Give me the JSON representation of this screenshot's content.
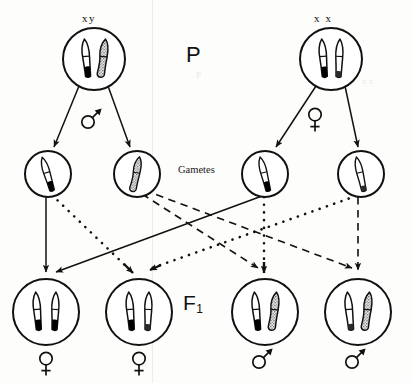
{
  "diagram": {
    "title_labels": {
      "parental": "P",
      "filial": "F",
      "filial_subscript": "1",
      "gametes": "Gametes"
    },
    "generations": [
      {
        "name": "parental",
        "label": "P",
        "cells": [
          {
            "id": "father",
            "genotype": "xy",
            "sex": "male",
            "sex_symbol": "male-symbol",
            "chromosomes": [
              "X",
              "Y"
            ],
            "cx": 94,
            "cy": 59,
            "r": 31
          },
          {
            "id": "mother",
            "genotype": "x x",
            "sex": "female",
            "sex_symbol": "female-symbol",
            "chromosomes": [
              "X",
              "X"
            ],
            "cx": 331,
            "cy": 59,
            "r": 31
          }
        ]
      },
      {
        "name": "gametes",
        "label": "Gametes",
        "cells": [
          {
            "id": "gamete-1",
            "parent": "father",
            "chromosomes": [
              "X"
            ],
            "cx": 48,
            "cy": 174,
            "r": 23
          },
          {
            "id": "gamete-2",
            "parent": "father",
            "chromosomes": [
              "Y"
            ],
            "cx": 137,
            "cy": 174,
            "r": 23
          },
          {
            "id": "gamete-3",
            "parent": "mother",
            "chromosomes": [
              "X"
            ],
            "cx": 265,
            "cy": 174,
            "r": 23
          },
          {
            "id": "gamete-4",
            "parent": "mother",
            "chromosomes": [
              "X"
            ],
            "cx": 361,
            "cy": 174,
            "r": 23
          }
        ]
      },
      {
        "name": "f1",
        "label": "F1",
        "cells": [
          {
            "id": "f1-1",
            "chromosomes": [
              "X",
              "X"
            ],
            "sex": "female",
            "sex_symbol": "female-symbol",
            "cx": 46,
            "cy": 312,
            "r": 33
          },
          {
            "id": "f1-2",
            "chromosomes": [
              "X",
              "X"
            ],
            "sex": "female",
            "sex_symbol": "female-symbol",
            "cx": 139,
            "cy": 312,
            "r": 33
          },
          {
            "id": "f1-3",
            "chromosomes": [
              "X",
              "Y"
            ],
            "sex": "male",
            "sex_symbol": "male-symbol",
            "cx": 265,
            "cy": 312,
            "r": 33
          },
          {
            "id": "f1-4",
            "chromosomes": [
              "X",
              "Y"
            ],
            "sex": "male",
            "sex_symbol": "male-symbol",
            "cx": 358,
            "cy": 312,
            "r": 33
          }
        ]
      }
    ],
    "meiosis_arrows": [
      {
        "from": "father",
        "to": "gamete-1",
        "style": "solid"
      },
      {
        "from": "father",
        "to": "gamete-2",
        "style": "solid"
      },
      {
        "from": "mother",
        "to": "gamete-3",
        "style": "solid"
      },
      {
        "from": "mother",
        "to": "gamete-4",
        "style": "solid"
      }
    ],
    "fertilization_arrows": [
      {
        "from": "gamete-1",
        "to": "f1-1",
        "style": "solid"
      },
      {
        "from": "gamete-1",
        "to": "f1-2",
        "style": "dotted"
      },
      {
        "from": "gamete-2",
        "to": "f1-3",
        "style": "dashed"
      },
      {
        "from": "gamete-2",
        "to": "f1-4",
        "style": "dashed"
      },
      {
        "from": "gamete-3",
        "to": "f1-3",
        "style": "dotted"
      },
      {
        "from": "gamete-3",
        "to": "f1-1",
        "style": "solid"
      },
      {
        "from": "gamete-4",
        "to": "f1-4",
        "style": "dashed"
      },
      {
        "from": "gamete-4",
        "to": "f1-2",
        "style": "dotted"
      }
    ],
    "colors": {
      "ink": "#111111",
      "background": "#fdfdfb",
      "chromosome_fill": "#ffffff",
      "chromosome_tip": "#000000",
      "chromosome_stipple": "#9a9a9a"
    },
    "faint_artifacts": [
      "P",
      "x x"
    ]
  }
}
